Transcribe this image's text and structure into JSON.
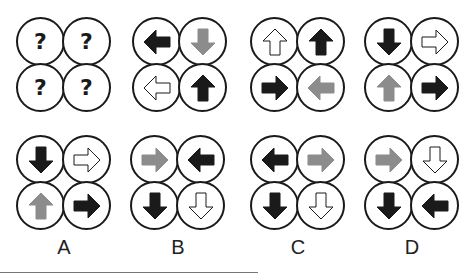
{
  "colors": {
    "black": "#1a1a1a",
    "grey": "#8c8c8c",
    "outline_fill": "#ffffff"
  },
  "question": {
    "cells": [
      "?",
      "?",
      "?",
      "?"
    ]
  },
  "sequence": [
    {
      "cells": [
        {
          "dir": "left",
          "style": "black"
        },
        {
          "dir": "down",
          "style": "grey"
        },
        {
          "dir": "left",
          "style": "outline"
        },
        {
          "dir": "up",
          "style": "black"
        }
      ]
    },
    {
      "cells": [
        {
          "dir": "up",
          "style": "outline"
        },
        {
          "dir": "up",
          "style": "black"
        },
        {
          "dir": "right",
          "style": "black"
        },
        {
          "dir": "left",
          "style": "grey"
        }
      ]
    },
    {
      "cells": [
        {
          "dir": "down",
          "style": "black"
        },
        {
          "dir": "right",
          "style": "outline"
        },
        {
          "dir": "up",
          "style": "grey"
        },
        {
          "dir": "right",
          "style": "black"
        }
      ]
    }
  ],
  "options": [
    {
      "label": "A",
      "cells": [
        {
          "dir": "down",
          "style": "black"
        },
        {
          "dir": "right",
          "style": "outline"
        },
        {
          "dir": "up",
          "style": "grey"
        },
        {
          "dir": "right",
          "style": "black"
        }
      ]
    },
    {
      "label": "B",
      "cells": [
        {
          "dir": "right",
          "style": "grey"
        },
        {
          "dir": "left",
          "style": "black"
        },
        {
          "dir": "down",
          "style": "black"
        },
        {
          "dir": "down",
          "style": "outline"
        }
      ]
    },
    {
      "label": "C",
      "cells": [
        {
          "dir": "left",
          "style": "black"
        },
        {
          "dir": "right",
          "style": "grey"
        },
        {
          "dir": "down",
          "style": "black"
        },
        {
          "dir": "down",
          "style": "outline"
        }
      ]
    },
    {
      "label": "D",
      "cells": [
        {
          "dir": "right",
          "style": "grey"
        },
        {
          "dir": "down",
          "style": "outline"
        },
        {
          "dir": "down",
          "style": "black"
        },
        {
          "dir": "left",
          "style": "black"
        }
      ]
    }
  ]
}
